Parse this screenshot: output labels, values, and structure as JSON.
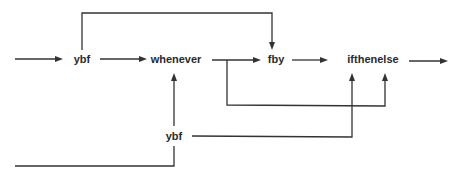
{
  "diagram": {
    "type": "dataflow",
    "nodes": {
      "ybf_main": {
        "label": "ybf",
        "x": 82,
        "y": 63
      },
      "whenever": {
        "label": "whenever",
        "x": 176,
        "y": 63
      },
      "fby": {
        "label": "fby",
        "x": 276,
        "y": 63
      },
      "ifthenelse": {
        "label": "ifthenelse",
        "x": 373,
        "y": 63
      },
      "ybf_lower": {
        "label": "ybf",
        "x": 174,
        "y": 140
      }
    },
    "edges": [
      {
        "from": "input_left",
        "to": "ybf_main"
      },
      {
        "from": "ybf_main",
        "to": "whenever"
      },
      {
        "from": "ybf_main",
        "to": "fby",
        "route": "over-top"
      },
      {
        "from": "whenever",
        "to": "fby"
      },
      {
        "from": "whenever",
        "to": "ifthenelse",
        "route": "below"
      },
      {
        "from": "fby",
        "to": "ifthenelse"
      },
      {
        "from": "ifthenelse",
        "to": "output_right"
      },
      {
        "from": "ybf_lower",
        "to": "whenever"
      },
      {
        "from": "ybf_lower",
        "to": "ifthenelse"
      },
      {
        "from": "input_lower_left",
        "to": "ybf_lower"
      }
    ],
    "stroke_color": "#333333",
    "text_color": "#2a2a2a"
  }
}
